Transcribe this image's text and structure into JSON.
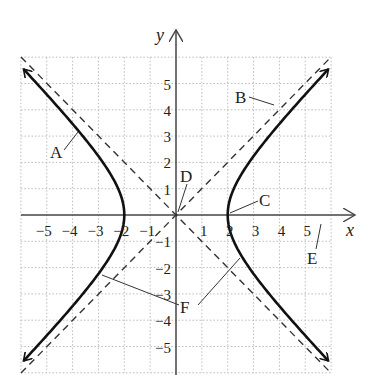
{
  "figure": {
    "type": "hyperbola-graph",
    "equation": "x^2/4 - y^2/4 = 1",
    "axes": {
      "x_label": "x",
      "y_label": "y",
      "x_ticks": [
        "−5",
        "−4",
        "−3",
        "−2",
        "−1",
        "1",
        "2",
        "3",
        "4",
        "5"
      ],
      "y_ticks": [
        "5",
        "4",
        "3",
        "2",
        "1",
        "−1",
        "−2",
        "−3",
        "−4",
        "−5"
      ],
      "range": [
        -6,
        6
      ]
    },
    "labels": {
      "A": "A",
      "B": "B",
      "C": "C",
      "D": "D",
      "E": "E",
      "F": "F"
    },
    "annotations": {
      "A": "left branch of hyperbola",
      "B": "asymptote y = x",
      "C": "vertex (2, 0)",
      "D": "center (0, 0)",
      "E": "x-axis",
      "F": "asymptotes"
    },
    "colors": {
      "curve": "#111111",
      "asymptote": "#333333",
      "grid": "#bbbbbb",
      "axis": "#444444"
    }
  }
}
